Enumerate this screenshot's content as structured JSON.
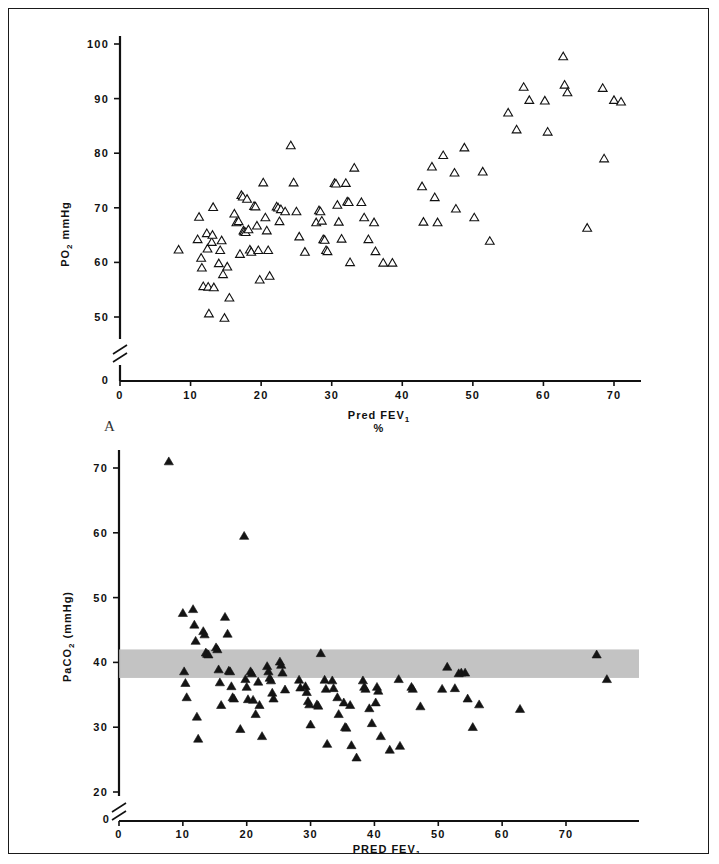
{
  "figure": {
    "panel_a_letter": "A",
    "panel_b_letter": "B"
  },
  "chart_data": [
    {
      "type": "scatter",
      "panel": "A",
      "title": "",
      "xlabel": "Pred FEV",
      "xlabel_sub": "1",
      "xlabel_units": "%",
      "ylabel": "PO",
      "ylabel_sub": "2",
      "ylabel_units": "mmHg",
      "xlim": [
        0,
        75
      ],
      "ylim": [
        45,
        102
      ],
      "axis_break_y": true,
      "grid": false,
      "legend": "none",
      "marker": "open-triangle",
      "xticks": [
        0,
        10,
        20,
        30,
        40,
        50,
        60,
        70
      ],
      "xtick_labels": [
        "0",
        "10",
        "20",
        "30",
        "40",
        "50",
        "60",
        "70"
      ],
      "yticks": [
        50,
        60,
        70,
        80,
        90,
        100
      ],
      "ytick_labels": [
        "50",
        "60",
        "70",
        "80",
        "90",
        "100"
      ],
      "ytick_zero_label": "0",
      "points": [
        [
          8.3,
          62.3
        ],
        [
          11.0,
          64.2
        ],
        [
          11.2,
          68.3
        ],
        [
          11.5,
          60.8
        ],
        [
          11.6,
          59.0
        ],
        [
          11.8,
          55.6
        ],
        [
          12.3,
          65.3
        ],
        [
          12.4,
          62.5
        ],
        [
          12.5,
          55.5
        ],
        [
          12.6,
          50.6
        ],
        [
          13.0,
          63.7
        ],
        [
          13.1,
          65.0
        ],
        [
          13.2,
          70.1
        ],
        [
          13.3,
          55.4
        ],
        [
          14.0,
          59.8
        ],
        [
          14.2,
          62.2
        ],
        [
          14.4,
          64.0
        ],
        [
          14.6,
          57.8
        ],
        [
          14.8,
          49.8
        ],
        [
          15.2,
          59.2
        ],
        [
          15.5,
          53.5
        ],
        [
          16.2,
          68.9
        ],
        [
          16.5,
          67.3
        ],
        [
          16.8,
          67.5
        ],
        [
          17.0,
          61.5
        ],
        [
          17.2,
          72.3
        ],
        [
          17.4,
          72.0
        ],
        [
          17.5,
          65.8
        ],
        [
          17.6,
          65.6
        ],
        [
          17.8,
          65.5
        ],
        [
          18.0,
          71.6
        ],
        [
          18.2,
          66.0
        ],
        [
          18.4,
          62.3
        ],
        [
          18.6,
          61.9
        ],
        [
          19.0,
          70.3
        ],
        [
          19.2,
          70.2
        ],
        [
          19.4,
          66.7
        ],
        [
          19.6,
          62.2
        ],
        [
          19.8,
          56.8
        ],
        [
          20.3,
          74.6
        ],
        [
          20.6,
          68.2
        ],
        [
          20.8,
          65.8
        ],
        [
          21.0,
          62.2
        ],
        [
          21.2,
          57.5
        ],
        [
          22.2,
          70.2
        ],
        [
          22.4,
          70.0
        ],
        [
          22.6,
          67.5
        ],
        [
          22.8,
          69.7
        ],
        [
          23.4,
          69.3
        ],
        [
          24.2,
          81.4
        ],
        [
          24.6,
          74.6
        ],
        [
          25.0,
          69.3
        ],
        [
          25.4,
          64.7
        ],
        [
          26.2,
          61.9
        ],
        [
          27.8,
          67.3
        ],
        [
          28.2,
          69.5
        ],
        [
          28.4,
          69.3
        ],
        [
          28.6,
          67.6
        ],
        [
          28.8,
          64.2
        ],
        [
          29.0,
          64.1
        ],
        [
          29.2,
          62.2
        ],
        [
          29.4,
          62.0
        ],
        [
          30.4,
          74.5
        ],
        [
          30.6,
          74.4
        ],
        [
          30.8,
          70.5
        ],
        [
          31.0,
          67.4
        ],
        [
          31.4,
          64.3
        ],
        [
          32.0,
          74.5
        ],
        [
          32.2,
          71.1
        ],
        [
          32.4,
          71.0
        ],
        [
          32.6,
          60.0
        ],
        [
          33.2,
          77.3
        ],
        [
          34.2,
          71.0
        ],
        [
          34.6,
          68.2
        ],
        [
          35.2,
          64.2
        ],
        [
          36.0,
          67.3
        ],
        [
          36.2,
          62.0
        ],
        [
          37.3,
          59.9
        ],
        [
          38.6,
          59.9
        ],
        [
          42.8,
          73.9
        ],
        [
          43.0,
          67.4
        ],
        [
          44.2,
          77.5
        ],
        [
          44.6,
          71.9
        ],
        [
          45.0,
          67.3
        ],
        [
          45.8,
          79.6
        ],
        [
          47.4,
          76.4
        ],
        [
          47.6,
          69.8
        ],
        [
          48.8,
          81.0
        ],
        [
          50.2,
          68.2
        ],
        [
          51.4,
          76.6
        ],
        [
          52.4,
          63.9
        ],
        [
          55.0,
          87.4
        ],
        [
          56.2,
          84.3
        ],
        [
          57.2,
          92.1
        ],
        [
          58.0,
          89.7
        ],
        [
          60.2,
          89.6
        ],
        [
          60.6,
          83.9
        ],
        [
          62.8,
          97.7
        ],
        [
          63.0,
          92.5
        ],
        [
          63.4,
          91.1
        ],
        [
          66.2,
          66.3
        ],
        [
          68.4,
          91.9
        ],
        [
          68.6,
          79.0
        ],
        [
          70.0,
          89.7
        ],
        [
          71.0,
          89.4
        ]
      ]
    },
    {
      "type": "scatter",
      "panel": "B",
      "title": "",
      "xlabel": "PRED FEV",
      "xlabel_sub": "1",
      "xlabel_units": "(%)",
      "ylabel": "PaCO",
      "ylabel_sub": "2",
      "ylabel_units": "(mmHg)",
      "xlim": [
        0,
        78
      ],
      "ylim": [
        21,
        72
      ],
      "axis_break_y": true,
      "grid": false,
      "legend": "none",
      "marker": "filled-triangle",
      "xticks": [
        0,
        10,
        20,
        30,
        40,
        50,
        60,
        70
      ],
      "xtick_labels": [
        "0",
        "10",
        "20",
        "30",
        "40",
        "50",
        "60",
        "70"
      ],
      "yticks": [
        20,
        30,
        40,
        50,
        60,
        70
      ],
      "ytick_labels": [
        "20",
        "30",
        "40",
        "50",
        "60",
        "70"
      ],
      "ytick_zero_label": "0",
      "normal_band": {
        "label": "",
        "ymin": 37.6,
        "ymax": 42.0,
        "color": "#b9b9b9"
      },
      "points": [
        [
          7.8,
          71.0
        ],
        [
          10.0,
          47.6
        ],
        [
          10.2,
          38.6
        ],
        [
          10.4,
          36.8
        ],
        [
          10.6,
          34.6
        ],
        [
          11.6,
          48.2
        ],
        [
          11.8,
          45.8
        ],
        [
          12.0,
          43.3
        ],
        [
          12.2,
          31.6
        ],
        [
          12.4,
          28.2
        ],
        [
          13.2,
          44.8
        ],
        [
          13.4,
          44.3
        ],
        [
          13.6,
          41.5
        ],
        [
          13.8,
          41.3
        ],
        [
          14.0,
          41.2
        ],
        [
          15.2,
          42.3
        ],
        [
          15.4,
          42.0
        ],
        [
          15.6,
          38.9
        ],
        [
          15.8,
          36.9
        ],
        [
          16.0,
          33.4
        ],
        [
          16.6,
          47.0
        ],
        [
          17.0,
          44.4
        ],
        [
          17.2,
          38.7
        ],
        [
          17.4,
          38.6
        ],
        [
          17.6,
          36.3
        ],
        [
          17.8,
          34.6
        ],
        [
          18.0,
          34.4
        ],
        [
          19.0,
          29.7
        ],
        [
          19.6,
          59.5
        ],
        [
          19.8,
          37.4
        ],
        [
          20.0,
          36.2
        ],
        [
          20.2,
          34.3
        ],
        [
          20.6,
          38.6
        ],
        [
          20.8,
          38.3
        ],
        [
          21.0,
          34.2
        ],
        [
          21.4,
          32.0
        ],
        [
          21.8,
          37.0
        ],
        [
          22.0,
          33.4
        ],
        [
          22.4,
          28.6
        ],
        [
          23.2,
          39.4
        ],
        [
          23.4,
          38.6
        ],
        [
          23.6,
          37.6
        ],
        [
          23.8,
          37.2
        ],
        [
          24.0,
          35.3
        ],
        [
          24.2,
          34.4
        ],
        [
          25.2,
          40.1
        ],
        [
          25.4,
          39.6
        ],
        [
          25.6,
          38.4
        ],
        [
          26.0,
          35.8
        ],
        [
          28.2,
          37.3
        ],
        [
          28.4,
          36.1
        ],
        [
          29.2,
          36.3
        ],
        [
          29.4,
          35.4
        ],
        [
          29.6,
          34.0
        ],
        [
          29.8,
          33.5
        ],
        [
          30.0,
          30.4
        ],
        [
          31.0,
          33.5
        ],
        [
          31.2,
          33.3
        ],
        [
          31.6,
          41.4
        ],
        [
          32.2,
          37.3
        ],
        [
          32.4,
          35.9
        ],
        [
          32.6,
          27.4
        ],
        [
          33.4,
          37.2
        ],
        [
          33.6,
          36.0
        ],
        [
          34.2,
          34.6
        ],
        [
          34.4,
          32.0
        ],
        [
          35.2,
          33.8
        ],
        [
          35.4,
          30.0
        ],
        [
          35.6,
          29.9
        ],
        [
          36.2,
          33.4
        ],
        [
          36.4,
          27.2
        ],
        [
          37.2,
          25.3
        ],
        [
          38.2,
          37.2
        ],
        [
          38.4,
          36.2
        ],
        [
          38.6,
          35.9
        ],
        [
          39.2,
          32.9
        ],
        [
          39.6,
          30.6
        ],
        [
          40.2,
          33.8
        ],
        [
          40.4,
          36.2
        ],
        [
          40.6,
          35.6
        ],
        [
          41.0,
          28.6
        ],
        [
          42.4,
          26.5
        ],
        [
          43.8,
          37.4
        ],
        [
          44.0,
          27.1
        ],
        [
          45.8,
          36.2
        ],
        [
          46.0,
          35.9
        ],
        [
          47.2,
          33.2
        ],
        [
          50.6,
          35.9
        ],
        [
          51.4,
          39.3
        ],
        [
          52.6,
          36.0
        ],
        [
          53.2,
          38.3
        ],
        [
          53.6,
          38.4
        ],
        [
          54.2,
          38.4
        ],
        [
          54.6,
          34.4
        ],
        [
          55.4,
          30.0
        ],
        [
          56.4,
          33.5
        ],
        [
          62.8,
          32.8
        ],
        [
          74.8,
          41.2
        ],
        [
          76.4,
          37.4
        ]
      ]
    }
  ]
}
